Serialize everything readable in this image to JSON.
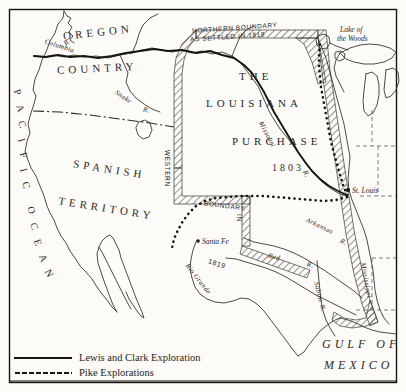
{
  "map": {
    "title": "Louisiana Purchase and Western Exploration Map",
    "frame_color": "#16150f",
    "paper_color": "#fcfbf7",
    "ink_color": "#2b2a27",
    "regions": [
      {
        "id": "oregon",
        "line1": "OREGON",
        "line2": "COUNTRY"
      },
      {
        "id": "spanish",
        "line1": "SPANISH",
        "line2": "TERRITORY"
      },
      {
        "id": "louisiana",
        "line1": "THE",
        "line2": "LOUISIANA",
        "line3": "PURCHASE",
        "line4": "1803"
      },
      {
        "id": "ocean",
        "line1": "PACIFIC",
        "line2": "OCEAN"
      },
      {
        "id": "gulf",
        "line1": "GULF OF",
        "line2": "MEXICO"
      }
    ],
    "region_labels": {
      "oregon": "OREGON",
      "country": "COUNTRY",
      "spanish": "SPANISH",
      "territory": "TERRITORY",
      "the": "THE",
      "louisiana": "LOUISIANA",
      "purchase": "PURCHASE",
      "year_1803": "1803",
      "gulf_of": "GULF OF",
      "mexico": "MEXICO"
    },
    "ocean_letters": [
      "P",
      "A",
      "C",
      "I",
      "F",
      "I",
      "C",
      "O",
      "C",
      "E",
      "A",
      "N"
    ],
    "boundaries": [
      {
        "id": "northern",
        "line1": "NORTHERN   BOUNDARY",
        "line2": "AS SETTLED IN 1818"
      },
      {
        "id": "western",
        "word1": "WESTERN",
        "word2": "BOUNDARY",
        "word3": "IN",
        "year": "1819"
      }
    ],
    "boundary_labels": {
      "northern_1": "NORTHERN   BOUNDARY",
      "northern_2": "AS SETTLED IN 1818",
      "western": "WESTERN",
      "boundary": "BOUNDARY",
      "in": "IN",
      "year_1819": "1819"
    },
    "rivers": [
      {
        "name": "Columbia R."
      },
      {
        "name": "Snake R."
      },
      {
        "name": "Missouri R."
      },
      {
        "name": "Arkansas R."
      },
      {
        "name": "Red R."
      },
      {
        "name": "Sabine R."
      },
      {
        "name": "Rio Grande"
      },
      {
        "name": "Mississippi R."
      }
    ],
    "river_labels": {
      "columbia": "Columbia",
      "columbia_r": "R.",
      "snake": "Snake",
      "snake_r": "R.",
      "missouri": "Missouri",
      "missouri_r": "R.",
      "arkansas": "Arkansas",
      "arkansas_r": "R.",
      "red": "Red",
      "red_r": "R.",
      "sabine": "Sabine R.",
      "rio_grande": "Rio Grande",
      "mississippi": "Mississippi"
    },
    "places": [
      {
        "name": "Lake of\nthe Woods",
        "line1": "Lake of",
        "line2": "the Woods"
      },
      {
        "name": "St. Louis"
      },
      {
        "name": "Santa Fe"
      }
    ],
    "place_labels": {
      "lake_of": "Lake of",
      "the_woods": "the Woods",
      "st_louis": "St. Louis",
      "santa_fe": "Santa Fe"
    }
  },
  "legend": {
    "items": [
      {
        "id": "lewis-clark",
        "style": "solid",
        "label": "Lewis and Clark Exploration"
      },
      {
        "id": "pike",
        "style": "dotted",
        "label": "Pike Explorations"
      }
    ]
  }
}
